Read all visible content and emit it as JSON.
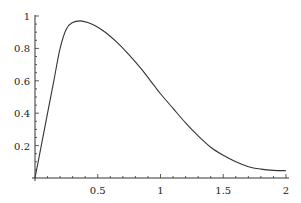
{
  "chart_data": {
    "type": "line",
    "title": "",
    "xlabel": "",
    "ylabel": "",
    "xlim": [
      0,
      2
    ],
    "ylim": [
      0,
      1
    ],
    "grid": false,
    "legend": null,
    "x_ticks": [
      0.5,
      1,
      1.5,
      2
    ],
    "x_tick_labels": [
      "0.5",
      "1",
      "1.5",
      "2"
    ],
    "y_ticks": [
      0.2,
      0.4,
      0.6,
      0.8,
      1
    ],
    "y_tick_labels": [
      "0.2",
      "0.4",
      "0.6",
      "0.8",
      "1"
    ],
    "series": [
      {
        "name": "f(x)",
        "color": "#333333",
        "x": [
          0,
          0.05,
          0.1,
          0.15,
          0.2,
          0.25,
          0.3,
          0.36,
          0.42,
          0.48,
          0.56,
          0.65,
          0.75,
          0.85,
          0.95,
          1.0,
          1.1,
          1.2,
          1.3,
          1.4,
          1.5,
          1.6,
          1.7,
          1.8,
          1.9,
          2.0
        ],
        "y": [
          0,
          0.2,
          0.4,
          0.6,
          0.8,
          0.92,
          0.96,
          0.97,
          0.96,
          0.94,
          0.9,
          0.84,
          0.76,
          0.67,
          0.57,
          0.52,
          0.43,
          0.34,
          0.26,
          0.19,
          0.14,
          0.1,
          0.07,
          0.055,
          0.047,
          0.045
        ]
      }
    ]
  }
}
